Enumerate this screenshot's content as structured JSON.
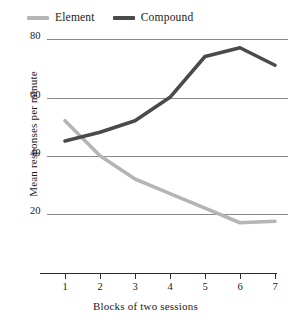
{
  "chart_data": {
    "type": "line",
    "title": "",
    "xlabel": "Blocks of two sessions",
    "ylabel": "Mean responses per minute",
    "categories": [
      "1",
      "2",
      "3",
      "4",
      "5",
      "6",
      "7"
    ],
    "x": [
      1,
      2,
      3,
      4,
      5,
      6,
      7
    ],
    "xlim": [
      0.5,
      7.5
    ],
    "ylim": [
      10,
      82
    ],
    "yticks": [
      20,
      40,
      60,
      80
    ],
    "ytick_labels": [
      "20",
      "40",
      "60",
      "80"
    ],
    "grid": "horizontal",
    "legend_position": "top-left",
    "series": [
      {
        "name": "Element",
        "color": "#b5b5b5",
        "values": [
          52,
          40,
          32,
          27,
          22,
          17,
          17.5
        ]
      },
      {
        "name": "Compound",
        "color": "#4a4a4a",
        "values": [
          45,
          48,
          52,
          60,
          74,
          77,
          71
        ]
      }
    ]
  },
  "legend": {
    "entries": [
      {
        "label": "Element",
        "color": "#b5b5b5"
      },
      {
        "label": "Compound",
        "color": "#4a4a4a"
      }
    ]
  },
  "axes": {
    "y": {
      "title": "Mean responses per minute",
      "ticks": [
        "80",
        "60",
        "40",
        "20"
      ]
    },
    "x": {
      "title": "Blocks of two sessions",
      "ticks": [
        "1",
        "2",
        "3",
        "4",
        "5",
        "6",
        "7"
      ]
    }
  },
  "colors": {
    "element_line": "#b5b5b5",
    "compound_line": "#4a4a4a",
    "gridline": "#8a8a8a",
    "axis": "#2b2b2b",
    "background": "#ffffff"
  }
}
